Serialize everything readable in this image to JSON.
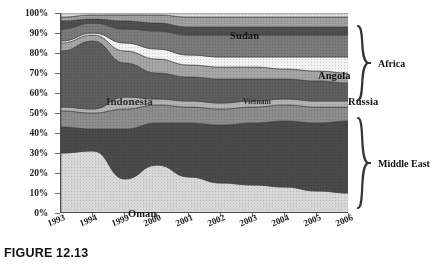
{
  "caption": "FIGURE 12.13",
  "axes": {
    "y_ticks": [
      "100%",
      "90%",
      "80%",
      "70%",
      "60%",
      "50%",
      "40%",
      "30%",
      "20%",
      "10%",
      "0%"
    ],
    "x_ticks": [
      "1993",
      "1994",
      "1999",
      "2000",
      "2001",
      "2002",
      "2003",
      "2004",
      "2005",
      "2006"
    ]
  },
  "groups": [
    {
      "label": "Africa",
      "name": "africa"
    },
    {
      "label": "Middle East",
      "name": "middle-east"
    }
  ],
  "series_labels": [
    {
      "text": "Sudan",
      "x": 170,
      "y": 22,
      "size": 10.5,
      "tone": "dark"
    },
    {
      "text": "Angola",
      "x": 258,
      "y": 62,
      "size": 10.5,
      "tone": "dark"
    },
    {
      "text": "Russia",
      "x": 288,
      "y": 88,
      "size": 10.5,
      "tone": "dark"
    },
    {
      "text": "Vietnam",
      "x": 183,
      "y": 88,
      "size": 7.5,
      "tone": "light"
    },
    {
      "text": "Indonesia",
      "x": 46,
      "y": 88,
      "size": 11,
      "tone": "light"
    },
    {
      "text": "Iran",
      "x": 155,
      "y": 128,
      "size": 10,
      "tone": "pale"
    },
    {
      "text": "Saudi Arabia",
      "x": 193,
      "y": 168,
      "size": 10,
      "tone": "pale"
    },
    {
      "text": "Oman",
      "x": 68,
      "y": 200,
      "size": 10.5,
      "tone": "dark"
    }
  ],
  "chart_data": {
    "type": "area",
    "title": "",
    "subtitle": "",
    "xlabel": "",
    "ylabel": "",
    "stacked": true,
    "normalized": "100% stacked",
    "grid": false,
    "legend": "in-plot labels plus right-side group brackets",
    "ylim": [
      0,
      100
    ],
    "ytick_values": [
      0,
      10,
      20,
      30,
      40,
      50,
      60,
      70,
      80,
      90,
      100
    ],
    "x": [
      "1993",
      "1994",
      "1999",
      "2000",
      "2001",
      "2002",
      "2003",
      "2004",
      "2005",
      "2006"
    ],
    "region_groups": {
      "Middle East": [
        "Oman",
        "Saudi Arabia",
        "Iran",
        "Other Middle East"
      ],
      "Africa": [
        "Angola",
        "Other Africa",
        "Sudan",
        "Other Africa (top)"
      ]
    },
    "series": [
      {
        "name": "Oman",
        "group": "Middle East",
        "color": "#d8d8d8",
        "values": [
          30,
          31,
          17,
          24,
          18,
          15,
          14,
          13,
          11,
          10
        ]
      },
      {
        "name": "Saudi Arabia",
        "group": "Middle East",
        "color": "#4a4a4a",
        "values": [
          13,
          11,
          25,
          21,
          27,
          29,
          31,
          33,
          34,
          36
        ]
      },
      {
        "name": "Iran",
        "group": "Middle East",
        "color": "#8c8c8c",
        "values": [
          8,
          8,
          10,
          9,
          8,
          8,
          8,
          8,
          8,
          7
        ]
      },
      {
        "name": "Other Middle East",
        "group": "Middle East",
        "color": "#b3b3b3",
        "values": [
          2,
          2,
          6,
          3,
          3,
          3,
          3,
          3,
          3,
          3
        ]
      },
      {
        "name": "Indonesia",
        "group": "Asia",
        "color": "#5e5e5e",
        "values": [
          28,
          34,
          17,
          13,
          12,
          12,
          11,
          10,
          10,
          9
        ]
      },
      {
        "name": "Vietnam",
        "group": "Asia",
        "color": "#a5a5a5",
        "values": [
          4,
          3,
          6,
          7,
          6,
          6,
          6,
          5,
          5,
          5
        ]
      },
      {
        "name": "Russia",
        "group": "Other",
        "color": "#f2f2f2",
        "values": [
          1,
          1,
          4,
          5,
          5,
          5,
          5,
          6,
          7,
          8
        ]
      },
      {
        "name": "Angola",
        "group": "Africa",
        "color": "#7a7a7a",
        "values": [
          6,
          5,
          7,
          9,
          10,
          11,
          11,
          11,
          11,
          11
        ]
      },
      {
        "name": "Other Africa",
        "group": "Africa",
        "color": "#4f4f4f",
        "values": [
          4,
          2,
          4,
          4,
          4,
          4,
          4,
          4,
          4,
          4
        ]
      },
      {
        "name": "Sudan",
        "group": "Africa",
        "color": "#9e9e9e",
        "values": [
          2,
          2,
          3,
          4,
          5,
          5,
          5,
          5,
          5,
          5
        ]
      },
      {
        "name": "Other",
        "group": "Africa",
        "color": "#dcdcdc",
        "values": [
          2,
          1,
          1,
          1,
          2,
          2,
          2,
          2,
          2,
          2
        ]
      }
    ]
  }
}
